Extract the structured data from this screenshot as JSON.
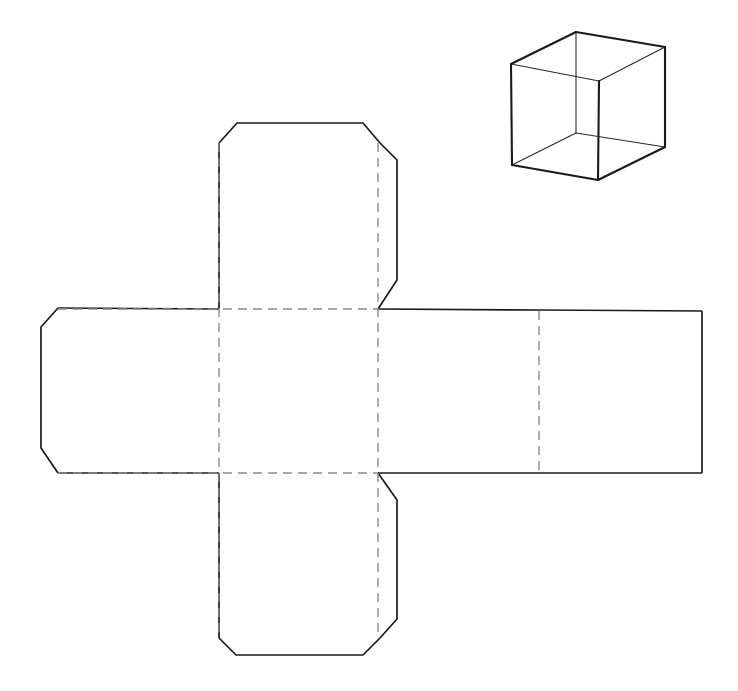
{
  "document": {
    "title": "Cube net and cube perspective drawing",
    "width": 738,
    "height": 691,
    "background_color": "#ffffff"
  },
  "style": {
    "cut_line_color": "#1a1a1a",
    "fold_line_color": "#8a8a8a",
    "cut_line_width": 1.7,
    "fold_line_width": 1.4,
    "fold_dash_pattern": "9 6",
    "cube_edge_color": "#1a1a1a"
  },
  "diagram": {
    "kind": "cube-net-with-glue-flaps",
    "panel_count": 6,
    "flap_count": 8,
    "net": {
      "center_square": {
        "left": 219,
        "top": 309,
        "right": 378,
        "bottom": 473
      },
      "left_panel": {
        "left": 58,
        "top": 309,
        "right": 219,
        "bottom": 473
      },
      "right_panel_1": {
        "left": 378,
        "top": 309,
        "right": 539,
        "bottom": 473
      },
      "right_panel_2": {
        "left": 539,
        "top": 309,
        "right": 702,
        "bottom": 473
      },
      "top_panel": {
        "left": 219,
        "top": 143,
        "right": 378,
        "bottom": 309
      },
      "bottom_panel": {
        "left": 219,
        "top": 473,
        "right": 378,
        "bottom": 638
      },
      "chamfer": 18,
      "outline_path": "M 237 123 L 363 123 L 397 160 L 397 280 L 378 309 L 702 311 L 702 473 L 378 473 L 397 500 L 397 619 L 363 655 L 236 655 L 219 638 L 219 473 L 58 473 L 41 448 L 41 327 L 58 308 L 219 309 L 219 143 Z",
      "fold_lines": [
        {
          "name": "fold-vertical-left",
          "x1": 219,
          "y1": 143,
          "x2": 219,
          "y2": 638
        },
        {
          "name": "fold-vertical-right",
          "x1": 378,
          "y1": 143,
          "x2": 378,
          "y2": 638
        },
        {
          "name": "fold-horizontal-top",
          "x1": 58,
          "y1": 309,
          "x2": 378,
          "y2": 309
        },
        {
          "name": "fold-horizontal-bottom",
          "x1": 58,
          "y1": 473,
          "x2": 378,
          "y2": 473
        },
        {
          "name": "fold-vertical-far-right",
          "x1": 539,
          "y1": 311,
          "x2": 539,
          "y2": 473
        }
      ]
    },
    "cube": {
      "kind": "open-top-cube-perspective",
      "vertices": {
        "top_back_left": [
          511,
          64
        ],
        "top_back": [
          576,
          32
        ],
        "top_right": [
          665,
          47
        ],
        "top_front": [
          599,
          81
        ],
        "bottom_left": [
          512,
          165
        ],
        "bottom_front": [
          598,
          180
        ],
        "bottom_right": [
          665,
          147
        ],
        "bottom_back": [
          576,
          133
        ]
      },
      "edges": [
        "top_back_left-top_back",
        "top_back-top_right",
        "top_right-top_front",
        "top_front-top_back_left",
        "top_back_left-bottom_left",
        "top_front-bottom_front",
        "top_right-bottom_right",
        "bottom_left-bottom_front",
        "bottom_front-bottom_right",
        "bottom_left-bottom_back",
        "bottom_back-bottom_right",
        "top_back-bottom_back"
      ]
    }
  },
  "labels": {
    "net_label": "",
    "cube_label": "",
    "caption": ""
  }
}
